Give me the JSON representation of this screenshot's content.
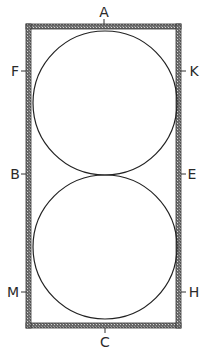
{
  "diagram": {
    "frame": {
      "x": 26,
      "y": 24,
      "width": 155,
      "height": 304,
      "border": 5,
      "color": "#3a3a3a"
    },
    "circles": [
      {
        "name": "upper-circle",
        "cx": 105,
        "cy": 103,
        "r": 72
      },
      {
        "name": "lower-circle",
        "cx": 105,
        "cy": 247,
        "r": 72
      }
    ],
    "labels": {
      "A": "A",
      "B": "B",
      "C": "C",
      "E": "E",
      "F": "F",
      "H": "H",
      "K": "K",
      "M": "M"
    },
    "label_positions": {
      "top": "A",
      "bottom": "C",
      "left": [
        "F",
        "B",
        "M"
      ],
      "right": [
        "K",
        "E",
        "H"
      ]
    }
  }
}
